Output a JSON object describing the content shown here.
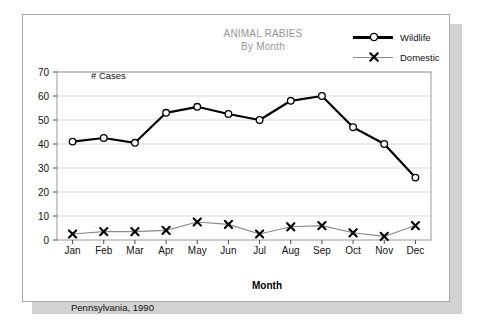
{
  "card": {
    "title_line1": "ANIMAL RABIES",
    "title_line2": "By Month",
    "footnote": "Pennsylvania, 1990",
    "y_caption": "# Cases",
    "border_color": "#a8a8a8",
    "shadow_color": "#d2d2d2",
    "title_color": "#969696"
  },
  "legend": {
    "items": [
      {
        "label": "Wildlife",
        "marker": "circle-marker",
        "line_color": "#000000",
        "line_width": 2.5
      },
      {
        "label": "Domestic",
        "marker": "x-marker",
        "line_color": "#8a8a8a",
        "line_width": 1.2
      }
    ]
  },
  "chart_data": {
    "type": "line",
    "title": "ANIMAL RABIES By Month",
    "subtitle": "By Month",
    "xlabel": "Month",
    "ylabel": "# Cases",
    "ylim": [
      0,
      70
    ],
    "yticks": [
      0,
      10,
      20,
      30,
      40,
      50,
      60,
      70
    ],
    "grid": true,
    "legend_position": "top-right",
    "annotation": "Pennsylvania, 1990",
    "categories": [
      "Jan",
      "Feb",
      "Mar",
      "Apr",
      "May",
      "Jun",
      "Jul",
      "Aug",
      "Sep",
      "Oct",
      "Nov",
      "Dec"
    ],
    "series": [
      {
        "name": "Wildlife",
        "marker": "circle",
        "color": "#000000",
        "values": [
          41,
          42.5,
          40.5,
          53,
          55.5,
          52.5,
          50,
          58,
          60,
          47,
          40,
          26
        ]
      },
      {
        "name": "Domestic",
        "marker": "x",
        "color": "#8a8a8a",
        "values": [
          2.5,
          3.5,
          3.5,
          4,
          7.5,
          6.5,
          2.5,
          5.5,
          6,
          3,
          1.5,
          6
        ]
      }
    ]
  }
}
